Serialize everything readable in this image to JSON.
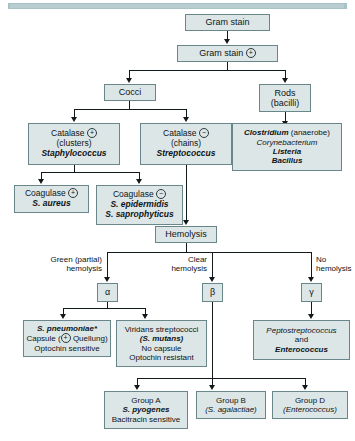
{
  "nodes": {
    "gram_stain": {
      "line1": "Gram stain"
    },
    "gram_pos": {
      "line1": "Gram stain",
      "symbol": "+"
    },
    "cocci": {
      "line1": "Cocci"
    },
    "rods": {
      "line1": "Rods",
      "line2": "(bacilli)"
    },
    "catalase_pos": {
      "line1": "Catalase",
      "symbol": "+",
      "line2": "(clusters)",
      "line3": "Staphylococcus"
    },
    "catalase_neg": {
      "line1": "Catalase",
      "symbol": "−",
      "line2": "(chains)",
      "line3": "Streptococcus"
    },
    "rods_list": {
      "line1a": "Clostridium",
      "line1b": " (anaerobe)",
      "line2": "Corynebacterium",
      "line3": "Listeria",
      "line4": "Bacillus"
    },
    "coagulase_pos": {
      "line1": "Coagulase",
      "symbol": "+",
      "line2": "S. aureus"
    },
    "coagulase_neg": {
      "line1": "Coagulase",
      "symbol": "−",
      "line2": "S. epidermidis",
      "line3": "S. saprophyticus"
    },
    "hemolysis": {
      "line1": "Hemolysis"
    },
    "alpha": {
      "letter": "α"
    },
    "beta": {
      "letter": "β"
    },
    "gamma": {
      "letter": "γ"
    },
    "s_pneumoniae": {
      "line1": "S. pneumoniae*",
      "line2a": "Capsule (",
      "line2sym": "+",
      "line2b": " Quellung)",
      "line3": "Optochin sensitive"
    },
    "viridans": {
      "line1": "Viridans streptococci",
      "line2": "(S. mutans)",
      "line3": "No capsule",
      "line4": "Optochin resistant"
    },
    "pepto": {
      "line1": "Peptostreptococcus",
      "line2": "and",
      "line3": "Enterococcus"
    },
    "group_a": {
      "line1": "Group A",
      "line2": "S. pyogenes",
      "line3": "Bacitracin sensitive"
    },
    "group_b": {
      "line1": "Group B",
      "line2": "(S. agalactiae)"
    },
    "group_d": {
      "line1": "Group D",
      "line2": "(Enterococcus)"
    }
  },
  "edge_labels": {
    "green_partial": {
      "line1": "Green (partial)",
      "line2": "hemolysis"
    },
    "clear": {
      "line1": "Clear",
      "line2": "hemolysis"
    },
    "none": {
      "line1": "No",
      "line2": "hemolysis"
    }
  },
  "colors": {
    "box_fill": "#dde6e6",
    "box_border": "#69878b",
    "line": "#12191d",
    "topbar": "#a9c4c6",
    "text": "#0d1418"
  }
}
